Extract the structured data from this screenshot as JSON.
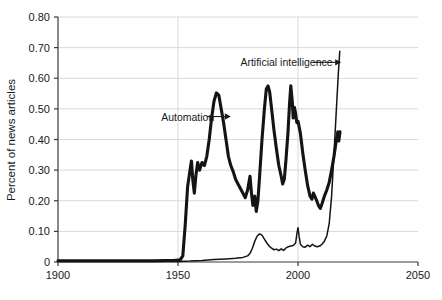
{
  "chart_data": {
    "type": "line",
    "title": "",
    "xlabel": "",
    "ylabel": "Percent of news articles",
    "xlim": [
      1900,
      2050
    ],
    "ylim": [
      0,
      0.8
    ],
    "xticks": [
      1900,
      1950,
      2000,
      2050
    ],
    "xtick_labels": [
      "1900",
      "1950",
      "2000",
      "2050"
    ],
    "yticks": [
      0,
      0.1,
      0.2,
      0.3,
      0.4,
      0.5,
      0.6,
      0.7,
      0.8
    ],
    "ytick_labels": [
      "0",
      "0.10",
      "0.20",
      "0.30",
      "0.40",
      "0.50",
      "0.60",
      "0.70",
      "0.80"
    ],
    "grid": "horizontal-and-vertical-light",
    "legend": "inline-annotations",
    "line_color": "#141414",
    "grid_color": "#d9d9d9",
    "axis_color": "#3a3a3a",
    "background": "#ffffff",
    "annotations": [
      {
        "name": "Automation",
        "text": "Automation",
        "text_x": 1943,
        "text_y": 0.475,
        "arrow_from_x": 1962,
        "arrow_to_x": 1972,
        "arrow_y": 0.475
      },
      {
        "name": "Artificial intelligence",
        "text": "Artificial intelligence",
        "text_x": 1976,
        "text_y": 0.652,
        "arrow_from_x": 2006,
        "arrow_to_x": 2018,
        "arrow_y": 0.652
      }
    ],
    "series": [
      {
        "name": "Automation",
        "stroke_width": 3.1,
        "points": [
          [
            1900,
            0.004
          ],
          [
            1910,
            0.004
          ],
          [
            1920,
            0.004
          ],
          [
            1930,
            0.004
          ],
          [
            1935,
            0.004
          ],
          [
            1940,
            0.004
          ],
          [
            1945,
            0.005
          ],
          [
            1948,
            0.005
          ],
          [
            1950,
            0.006
          ],
          [
            1951,
            0.008
          ],
          [
            1952,
            0.02
          ],
          [
            1953,
            0.12
          ],
          [
            1954,
            0.245
          ],
          [
            1955,
            0.3
          ],
          [
            1955.6,
            0.33
          ],
          [
            1956.2,
            0.265
          ],
          [
            1956.8,
            0.225
          ],
          [
            1957.5,
            0.285
          ],
          [
            1958.2,
            0.325
          ],
          [
            1959,
            0.3
          ],
          [
            1960,
            0.325
          ],
          [
            1961,
            0.315
          ],
          [
            1962,
            0.345
          ],
          [
            1963,
            0.4
          ],
          [
            1964,
            0.47
          ],
          [
            1965,
            0.525
          ],
          [
            1966,
            0.552
          ],
          [
            1967,
            0.545
          ],
          [
            1968,
            0.5
          ],
          [
            1969,
            0.455
          ],
          [
            1970,
            0.4
          ],
          [
            1971,
            0.345
          ],
          [
            1972,
            0.315
          ],
          [
            1973,
            0.295
          ],
          [
            1974,
            0.27
          ],
          [
            1975,
            0.255
          ],
          [
            1976,
            0.24
          ],
          [
            1977,
            0.225
          ],
          [
            1978,
            0.21
          ],
          [
            1979,
            0.235
          ],
          [
            1980,
            0.28
          ],
          [
            1980.6,
            0.225
          ],
          [
            1981.2,
            0.185
          ],
          [
            1982,
            0.215
          ],
          [
            1982.6,
            0.165
          ],
          [
            1983.3,
            0.2
          ],
          [
            1984,
            0.28
          ],
          [
            1985,
            0.4
          ],
          [
            1986,
            0.5
          ],
          [
            1986.8,
            0.565
          ],
          [
            1987.5,
            0.575
          ],
          [
            1988.2,
            0.555
          ],
          [
            1989,
            0.5
          ],
          [
            1990,
            0.43
          ],
          [
            1991,
            0.37
          ],
          [
            1992,
            0.315
          ],
          [
            1993,
            0.28
          ],
          [
            1993.6,
            0.255
          ],
          [
            1994.3,
            0.27
          ],
          [
            1995,
            0.335
          ],
          [
            1995.8,
            0.42
          ],
          [
            1996.5,
            0.52
          ],
          [
            1997,
            0.575
          ],
          [
            1997.6,
            0.525
          ],
          [
            1998,
            0.47
          ],
          [
            1998.5,
            0.505
          ],
          [
            1999,
            0.485
          ],
          [
            1999.5,
            0.455
          ],
          [
            2000,
            0.46
          ],
          [
            2001,
            0.42
          ],
          [
            2002,
            0.355
          ],
          [
            2003,
            0.3
          ],
          [
            2004,
            0.25
          ],
          [
            2005,
            0.215
          ],
          [
            2005.8,
            0.205
          ],
          [
            2006.4,
            0.225
          ],
          [
            2007,
            0.215
          ],
          [
            2007.8,
            0.2
          ],
          [
            2008.5,
            0.185
          ],
          [
            2009.3,
            0.175
          ],
          [
            2010,
            0.19
          ],
          [
            2011,
            0.215
          ],
          [
            2012,
            0.235
          ],
          [
            2013,
            0.26
          ],
          [
            2014,
            0.3
          ],
          [
            2015,
            0.345
          ],
          [
            2016,
            0.4
          ],
          [
            2016.6,
            0.425
          ],
          [
            2017,
            0.395
          ],
          [
            2017.5,
            0.425
          ]
        ]
      },
      {
        "name": "Artificial intelligence",
        "stroke_width": 1.5,
        "points": [
          [
            1900,
            0.002
          ],
          [
            1930,
            0.002
          ],
          [
            1950,
            0.002
          ],
          [
            1955,
            0.003
          ],
          [
            1960,
            0.005
          ],
          [
            1965,
            0.008
          ],
          [
            1970,
            0.01
          ],
          [
            1974,
            0.012
          ],
          [
            1977,
            0.015
          ],
          [
            1979,
            0.02
          ],
          [
            1980,
            0.028
          ],
          [
            1981,
            0.045
          ],
          [
            1982,
            0.068
          ],
          [
            1983,
            0.085
          ],
          [
            1984,
            0.092
          ],
          [
            1985,
            0.088
          ],
          [
            1986,
            0.075
          ],
          [
            1987,
            0.062
          ],
          [
            1988,
            0.052
          ],
          [
            1989,
            0.045
          ],
          [
            1990,
            0.04
          ],
          [
            1991,
            0.042
          ],
          [
            1992,
            0.037
          ],
          [
            1993,
            0.043
          ],
          [
            1994,
            0.038
          ],
          [
            1995,
            0.046
          ],
          [
            1996,
            0.05
          ],
          [
            1997,
            0.052
          ],
          [
            1998,
            0.054
          ],
          [
            1999,
            0.062
          ],
          [
            1999.6,
            0.095
          ],
          [
            2000,
            0.112
          ],
          [
            2000.5,
            0.082
          ],
          [
            2001,
            0.058
          ],
          [
            2002,
            0.05
          ],
          [
            2003,
            0.048
          ],
          [
            2004,
            0.055
          ],
          [
            2005,
            0.05
          ],
          [
            2006,
            0.058
          ],
          [
            2007,
            0.052
          ],
          [
            2008,
            0.05
          ],
          [
            2009,
            0.052
          ],
          [
            2010,
            0.058
          ],
          [
            2011,
            0.068
          ],
          [
            2012,
            0.085
          ],
          [
            2013,
            0.125
          ],
          [
            2014,
            0.215
          ],
          [
            2015,
            0.355
          ],
          [
            2016,
            0.5
          ],
          [
            2016.8,
            0.615
          ],
          [
            2017.4,
            0.688
          ]
        ]
      }
    ]
  }
}
